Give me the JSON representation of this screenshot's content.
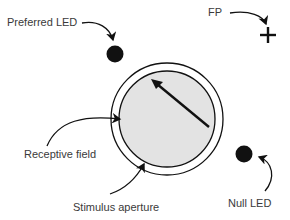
{
  "diagram": {
    "labels": {
      "preferred_led": "Preferred LED",
      "fp": "FP",
      "receptive_field": "Receptive field",
      "stimulus_aperture": "Stimulus aperture",
      "null_led": "Null LED"
    },
    "colors": {
      "background": "#ffffff",
      "receptive_field_fill": "#e3e3e3",
      "stroke": "#111111",
      "text": "#3a3a3a"
    },
    "icons": {
      "fixation_point": "plus-icon",
      "led": "filled-circle",
      "motion_direction": "arrow-icon"
    }
  }
}
